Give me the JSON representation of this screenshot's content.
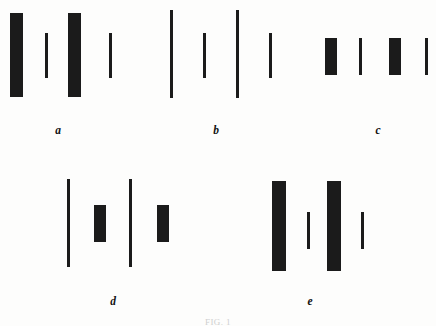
{
  "figure": {
    "caption": "FIG. 1",
    "ink_color": "#1b1b1b",
    "background_color": "#fdfdfc",
    "width": 436,
    "height": 326
  },
  "chart_data": {
    "type": "diagram",
    "title": "FIG. 1",
    "xlabel": "",
    "ylabel": "",
    "groups": [
      {
        "label": "a",
        "label_x": 58,
        "label_y": 125,
        "pattern": "thick-thin-thick-thin, equal tall height",
        "bars": [
          {
            "name": "bar-a-1",
            "kind": "thick",
            "x": 10,
            "y": 13,
            "width": 13,
            "height": 84
          },
          {
            "name": "bar-a-2",
            "kind": "thin",
            "x": 45,
            "y": 33,
            "width": 3,
            "height": 45
          },
          {
            "name": "bar-a-3",
            "kind": "thick",
            "x": 68,
            "y": 13,
            "width": 13,
            "height": 84
          },
          {
            "name": "bar-a-4",
            "kind": "thin",
            "x": 109,
            "y": 33,
            "width": 3,
            "height": 45
          }
        ]
      },
      {
        "label": "b",
        "label_x": 216,
        "label_y": 125,
        "pattern": "tall-short-tall-short, equal thin width",
        "bars": [
          {
            "name": "bar-b-1",
            "kind": "thin",
            "x": 170,
            "y": 10,
            "width": 3,
            "height": 88
          },
          {
            "name": "bar-b-2",
            "kind": "thin",
            "x": 203,
            "y": 33,
            "width": 3,
            "height": 45
          },
          {
            "name": "bar-b-3",
            "kind": "thin",
            "x": 236,
            "y": 10,
            "width": 3,
            "height": 88
          },
          {
            "name": "bar-b-4",
            "kind": "thin",
            "x": 269,
            "y": 33,
            "width": 3,
            "height": 45
          }
        ]
      },
      {
        "label": "c",
        "label_x": 378,
        "label_y": 125,
        "pattern": "thick-thin-thick-thin, equal short height",
        "bars": [
          {
            "name": "bar-c-1",
            "kind": "thick",
            "x": 325,
            "y": 38,
            "width": 12,
            "height": 37
          },
          {
            "name": "bar-c-2",
            "kind": "thin",
            "x": 359,
            "y": 38,
            "width": 3,
            "height": 37
          },
          {
            "name": "bar-c-3",
            "kind": "thick",
            "x": 389,
            "y": 38,
            "width": 12,
            "height": 37
          },
          {
            "name": "bar-c-4",
            "kind": "thin",
            "x": 425,
            "y": 38,
            "width": 3,
            "height": 37
          }
        ]
      },
      {
        "label": "d",
        "label_x": 113,
        "label_y": 296,
        "pattern": "tall-thin, short-thick, tall-thin, short-thick",
        "bars": [
          {
            "name": "bar-d-1",
            "kind": "thin",
            "x": 67,
            "y": 179,
            "width": 3,
            "height": 88
          },
          {
            "name": "bar-d-2",
            "kind": "thick",
            "x": 94,
            "y": 205,
            "width": 12,
            "height": 37
          },
          {
            "name": "bar-d-3",
            "kind": "thin",
            "x": 129,
            "y": 179,
            "width": 3,
            "height": 88
          },
          {
            "name": "bar-d-4",
            "kind": "thick",
            "x": 157,
            "y": 205,
            "width": 12,
            "height": 37
          }
        ]
      },
      {
        "label": "e",
        "label_x": 310,
        "label_y": 296,
        "pattern": "tall-thick, short-thin, tall-thick, short-thin",
        "bars": [
          {
            "name": "bar-e-1",
            "kind": "thick",
            "x": 272,
            "y": 181,
            "width": 14,
            "height": 90
          },
          {
            "name": "bar-e-2",
            "kind": "thin",
            "x": 307,
            "y": 212,
            "width": 3,
            "height": 37
          },
          {
            "name": "bar-e-3",
            "kind": "thick",
            "x": 327,
            "y": 181,
            "width": 14,
            "height": 90
          },
          {
            "name": "bar-e-4",
            "kind": "thin",
            "x": 361,
            "y": 212,
            "width": 3,
            "height": 37
          }
        ]
      }
    ]
  }
}
